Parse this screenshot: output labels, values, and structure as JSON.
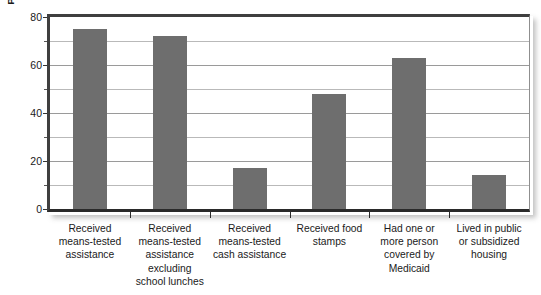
{
  "chart_data": {
    "type": "bar",
    "title": "",
    "subtitle": "",
    "xlabel": "",
    "ylabel": "Percentage of Poor Who Partcipate",
    "ylim": [
      0,
      80
    ],
    "yticks": [
      0,
      20,
      40,
      60,
      80
    ],
    "yminorticks": [
      10,
      30,
      50,
      70
    ],
    "ytick_labels": [
      "0",
      "20",
      "40",
      "60",
      "80"
    ],
    "grid": true,
    "grid_axis": "y",
    "legend": false,
    "legend_position": "none",
    "bar_color": "#6e6e6e",
    "categories": [
      "Received means-tested assistance",
      "Received means-tested assistance excluding school lunches",
      "Received means-tested cash assistance",
      "Received food stamps",
      "Had one or more person covered by Medicaid",
      "Lived in public or subsidized housing"
    ],
    "category_lines": [
      [
        "Received",
        "means-tested",
        "assistance"
      ],
      [
        "Received",
        "means-tested",
        "assistance",
        "excluding",
        "school lunches"
      ],
      [
        "Received",
        "means-tested",
        "cash assistance"
      ],
      [
        "Received food",
        "stamps"
      ],
      [
        "Had one or",
        "more person",
        "covered by",
        "Medicaid"
      ],
      [
        "Lived in public",
        "or subsidized",
        "housing"
      ]
    ],
    "values": [
      75,
      72,
      17,
      48,
      63,
      14
    ]
  }
}
